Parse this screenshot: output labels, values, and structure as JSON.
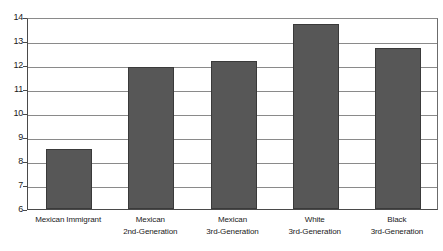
{
  "chart_data": {
    "type": "bar",
    "title": "",
    "subtitle": "",
    "xlabel": "",
    "ylabel": "",
    "categories": [
      "Mexican Immigrant",
      "Mexican 2nd-Generation",
      "Mexican 3rd-Generation",
      "White 3rd-Generation",
      "Black 3rd-Generation"
    ],
    "category_lines": [
      [
        "Mexican Immigrant",
        ""
      ],
      [
        "Mexican",
        "2nd-Generation"
      ],
      [
        "Mexican",
        "3rd-Generation"
      ],
      [
        "White",
        "3rd-Generation"
      ],
      [
        "Black",
        "3rd-Generation"
      ]
    ],
    "values": [
      8.5,
      11.9,
      12.15,
      13.7,
      12.7
    ],
    "ylim": [
      6,
      14
    ],
    "yticks": [
      6,
      7,
      8,
      9,
      10,
      11,
      12,
      13,
      14
    ],
    "ytick_labels": [
      "6",
      "7",
      "8",
      "9",
      "10",
      "11",
      "12",
      "13",
      "14"
    ],
    "grid": true,
    "legend": false,
    "legend_position": "none",
    "bar_color": "#575757",
    "bar_border_color": "#3a3a3a",
    "gridline_color": "#8a8a8a",
    "axis_color": "#4a4a4a",
    "background_color": "#ffffff"
  }
}
